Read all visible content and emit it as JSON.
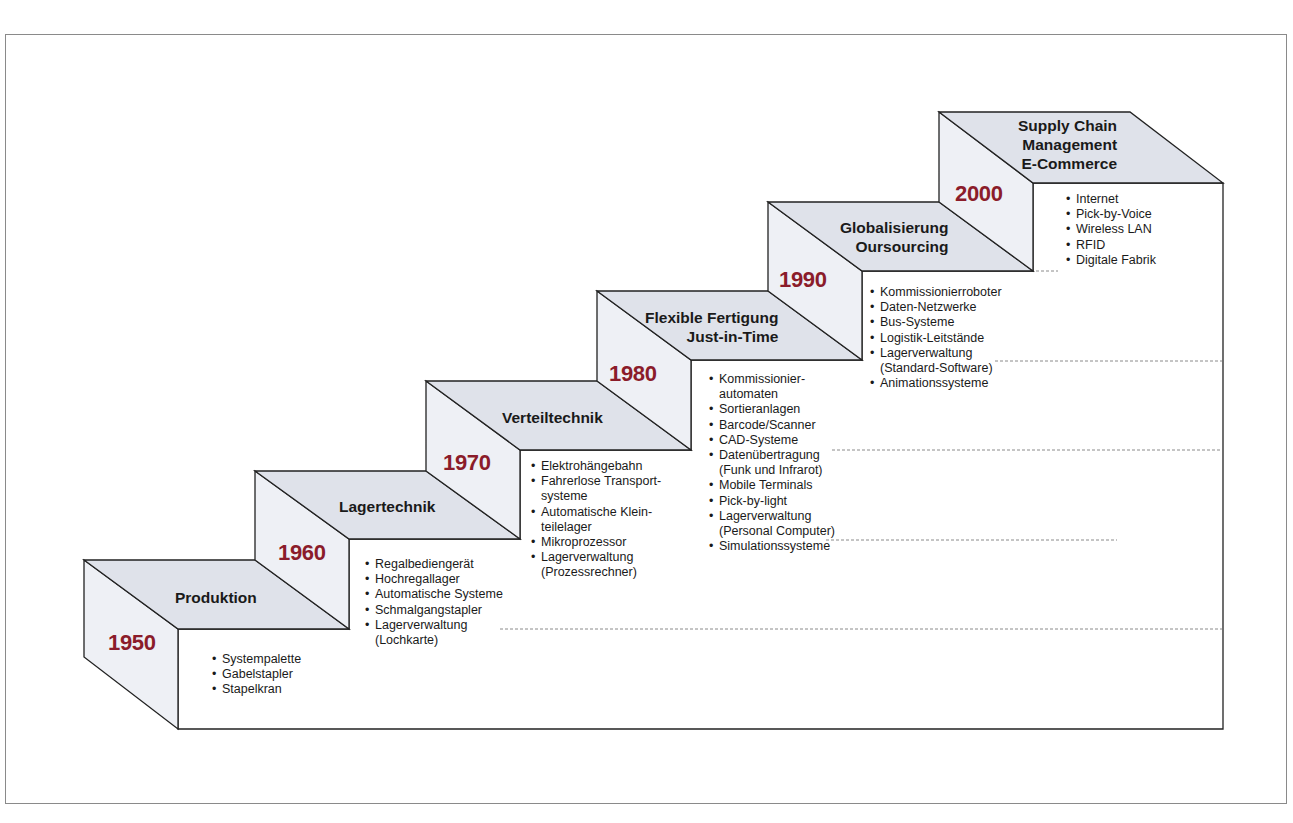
{
  "diagram": {
    "type": "staircase-timeline",
    "colors": {
      "year": "#8b1c2a",
      "top_face": "#dfe2ea",
      "side_face": "#eef0f5",
      "front_face": "#ffffff",
      "outline": "#222222"
    },
    "steps": [
      {
        "year": "1950",
        "title_lines": [
          "Produktion"
        ],
        "items": [
          {
            "text": "Systempalette"
          },
          {
            "text": "Gabelstapler"
          },
          {
            "text": "Stapelkran"
          }
        ]
      },
      {
        "year": "1960",
        "title_lines": [
          "Lagertechnik"
        ],
        "items": [
          {
            "text": "Regalbediengerät"
          },
          {
            "text": "Hochregallager"
          },
          {
            "text": "Automatische Systeme"
          },
          {
            "text": "Schmalgangstapler"
          },
          {
            "text": "Lagerverwaltung",
            "cont": "(Lochkarte)"
          }
        ]
      },
      {
        "year": "1970",
        "title_lines": [
          "Verteiltechnik"
        ],
        "items": [
          {
            "text": "Elektrohängebahn"
          },
          {
            "text": "Fahrerlose Transport-",
            "cont": "systeme"
          },
          {
            "text": "Automatische Klein-",
            "cont": "teilelager"
          },
          {
            "text": "Mikroprozessor"
          },
          {
            "text": "Lagerverwaltung",
            "cont": "(Prozessrechner)"
          }
        ]
      },
      {
        "year": "1980",
        "title_lines": [
          "Flexible Fertigung",
          "Just-in-Time"
        ],
        "items": [
          {
            "text": "Kommissionier-",
            "cont": "automaten"
          },
          {
            "text": "Sortieranlagen"
          },
          {
            "text": "Barcode/Scanner"
          },
          {
            "text": "CAD-Systeme"
          },
          {
            "text": "Datenübertragung",
            "cont": "(Funk und Infrarot)"
          },
          {
            "text": "Mobile Terminals"
          },
          {
            "text": "Pick-by-light"
          },
          {
            "text": "Lagerverwaltung",
            "cont": "(Personal Computer)"
          },
          {
            "text": "Simulationssysteme"
          }
        ]
      },
      {
        "year": "1990",
        "title_lines": [
          "Globalisierung",
          "Oursourcing"
        ],
        "items": [
          {
            "text": "Kommissionierroboter"
          },
          {
            "text": "Daten-Netzwerke"
          },
          {
            "text": "Bus-Systeme"
          },
          {
            "text": "Logistik-Leitstände"
          },
          {
            "text": "Lagerverwaltung",
            "cont": "(Standard-Software)"
          },
          {
            "text": "Animationssysteme"
          }
        ]
      },
      {
        "year": "2000",
        "title_lines": [
          "Supply Chain",
          "Management",
          "E-Commerce"
        ],
        "items": [
          {
            "text": "Internet"
          },
          {
            "text": "Pick-by-Voice"
          },
          {
            "text": "Wireless LAN"
          },
          {
            "text": "RFID"
          },
          {
            "text": "Digitale Fabrik"
          }
        ]
      }
    ]
  }
}
